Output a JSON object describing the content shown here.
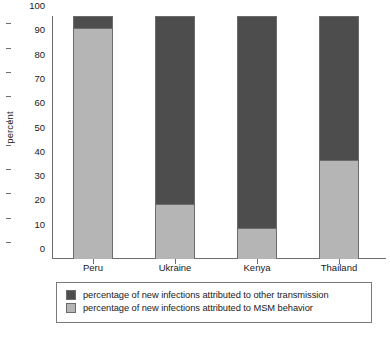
{
  "chart_data": {
    "type": "bar",
    "stacked": true,
    "title": "",
    "xlabel": "",
    "ylabel": "percent",
    "ylim": [
      0,
      100
    ],
    "ytick_step": 10,
    "yticks": [
      100,
      90,
      80,
      70,
      60,
      50,
      40,
      30,
      20,
      10,
      0
    ],
    "grid": false,
    "legend_position": "below-axis",
    "categories": [
      "Peru",
      "Ukraine",
      "Kenya",
      "Thailand"
    ],
    "series": [
      {
        "name": "percentage of new infections attributed to other transmission",
        "color": "#4d4d4d",
        "values": [
          5,
          77.5,
          87.5,
          59.5
        ]
      },
      {
        "name": "percentage of new infections attributed to MSM behavior",
        "color": "#b5b5b5",
        "values": [
          95,
          22.5,
          12.5,
          40.5
        ]
      }
    ]
  },
  "axis": {
    "y_title": "percent"
  },
  "legend": {
    "items": [
      {
        "label": "percentage of new infections attributed to other transmission",
        "color": "#4d4d4d"
      },
      {
        "label": "percentage of new infections attributed to MSM behavior",
        "color": "#b5b5b5"
      }
    ]
  },
  "colors": {
    "dark_series": "#4d4d4d",
    "light_series": "#b5b5b5",
    "axis_line": "#6d6d6d",
    "bar_outline": "#6b6b6b",
    "text": "#1a1a1a",
    "background": "#ffffff"
  }
}
